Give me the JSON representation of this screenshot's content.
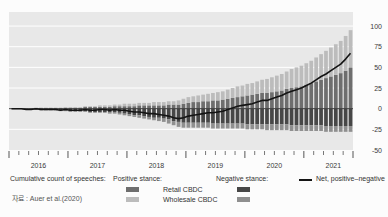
{
  "chart_data": {
    "type": "bar",
    "subtype": "stacked-bars-with-line",
    "title": "",
    "x_unit": "month",
    "x_start": "2016-01",
    "x_end": "2021-10",
    "years": [
      "2016",
      "2017",
      "2018",
      "2019",
      "2020",
      "2021"
    ],
    "y_axis": {
      "side": "right",
      "ticks": [
        100,
        75,
        50,
        25,
        0,
        -25,
        -50
      ],
      "ylim": [
        -50,
        117
      ],
      "grid": true
    },
    "legend_position": "bottom",
    "series": [
      {
        "name": "Retail CBDC (positive stance)",
        "type": "bar",
        "stack": "positive",
        "color": "#6e6e6e",
        "values": [
          0,
          0,
          0,
          0,
          0,
          1,
          1,
          1,
          1,
          1,
          1,
          1,
          1,
          1,
          1,
          2,
          2,
          2,
          2,
          2,
          2,
          3,
          3,
          3,
          3,
          3,
          4,
          4,
          4,
          4,
          4,
          4,
          5,
          5,
          5,
          6,
          7,
          8,
          8,
          9,
          9,
          10,
          10,
          11,
          12,
          13,
          14,
          15,
          16,
          17,
          18,
          19,
          19,
          20,
          21,
          22,
          24,
          25,
          26,
          27,
          29,
          31,
          33,
          35,
          37,
          39,
          41,
          43,
          46,
          50
        ]
      },
      {
        "name": "Wholesale CBDC (positive stance)",
        "type": "bar",
        "stack": "positive",
        "color": "#bcbcbc",
        "values": [
          0,
          0,
          0,
          0,
          0,
          0,
          0,
          0,
          0,
          0,
          0,
          1,
          1,
          1,
          1,
          1,
          1,
          1,
          2,
          2,
          2,
          2,
          2,
          3,
          3,
          3,
          3,
          3,
          3,
          4,
          4,
          4,
          4,
          4,
          5,
          6,
          7,
          7,
          8,
          8,
          9,
          9,
          10,
          10,
          11,
          12,
          13,
          13,
          14,
          14,
          15,
          16,
          17,
          18,
          19,
          20,
          21,
          23,
          24,
          25,
          26,
          27,
          29,
          31,
          33,
          35,
          37,
          39,
          42,
          45
        ]
      },
      {
        "name": "Retail CBDC (negative stance)",
        "type": "bar",
        "stack": "negative",
        "color": "#474747",
        "values": [
          0,
          0,
          0,
          1,
          1,
          1,
          1,
          1,
          1,
          1,
          2,
          2,
          3,
          3,
          3,
          3,
          4,
          4,
          4,
          4,
          4,
          4,
          5,
          6,
          7,
          8,
          8,
          9,
          10,
          11,
          11,
          12,
          13,
          15,
          16,
          17,
          17,
          17,
          17,
          17,
          17,
          18,
          18,
          18,
          18,
          18,
          18,
          18,
          19,
          19,
          19,
          19,
          19,
          19,
          19,
          19,
          19,
          20,
          20,
          20,
          20,
          20,
          20,
          20,
          21,
          21,
          21,
          21,
          21,
          21
        ]
      },
      {
        "name": "Wholesale CBDC (negative stance)",
        "type": "bar",
        "stack": "negative",
        "color": "#8f8f8f",
        "values": [
          0,
          0,
          0,
          0,
          0,
          0,
          1,
          1,
          1,
          1,
          1,
          1,
          1,
          1,
          1,
          1,
          1,
          1,
          1,
          1,
          2,
          2,
          2,
          2,
          2,
          2,
          3,
          3,
          3,
          3,
          4,
          4,
          5,
          5,
          6,
          6,
          6,
          6,
          6,
          6,
          6,
          6,
          6,
          6,
          6,
          6,
          6,
          6,
          6,
          6,
          6,
          6,
          7,
          7,
          7,
          7,
          7,
          7,
          7,
          7,
          7,
          7,
          7,
          7,
          7,
          7,
          7,
          7,
          7,
          7
        ]
      },
      {
        "name": "Net, positive-negative",
        "type": "line",
        "color": "#141414",
        "values": [
          0,
          0,
          0,
          -1,
          -1,
          0,
          -1,
          -1,
          -1,
          -1,
          -2,
          -1,
          -2,
          -2,
          -2,
          -1,
          -2,
          -2,
          -1,
          -1,
          -2,
          -1,
          -2,
          -2,
          -3,
          -4,
          -4,
          -5,
          -6,
          -6,
          -7,
          -8,
          -9,
          -11,
          -12,
          -11,
          -9,
          -8,
          -7,
          -6,
          -5,
          -5,
          -4,
          -3,
          -1,
          1,
          3,
          4,
          5,
          6,
          8,
          10,
          10,
          12,
          14,
          16,
          19,
          21,
          23,
          25,
          28,
          31,
          35,
          39,
          42,
          46,
          50,
          54,
          60,
          67
        ]
      }
    ]
  },
  "legend": {
    "count_label": "Cumulative count of speeches:",
    "positive_header": "Positive stance:",
    "negative_header": "Negative stance:",
    "retail_label": "Retail CBDC",
    "wholesale_label": "Wholesale CBDC",
    "net_label": "Net, positive–negative"
  },
  "source": "자료 :  Auer et al.(2020)",
  "colors": {
    "plot_bg": "#e8e8e8",
    "grid": "#ffffff",
    "pos_retail": "#6e6e6e",
    "pos_wholesale": "#bcbcbc",
    "neg_retail": "#474747",
    "neg_wholesale": "#8f8f8f",
    "net_line": "#141414",
    "zero_line": "#3a3a3a",
    "axis_text": "#3a3a3a"
  }
}
